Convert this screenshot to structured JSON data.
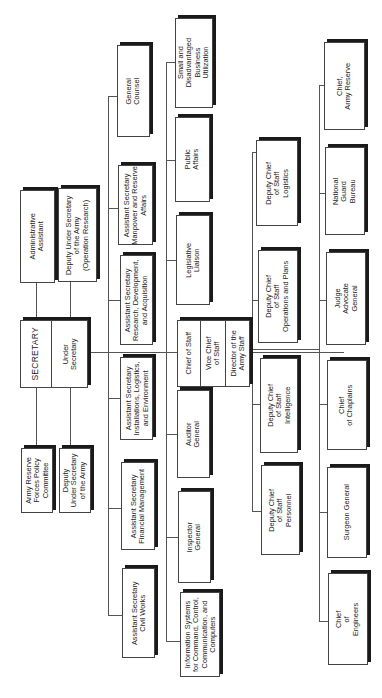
{
  "diagram": {
    "type": "org-chart",
    "orientation": "rotated-90-clockwise",
    "top": {
      "secretary": "SECRETARY",
      "under_secretary": "Under\nSecretary"
    },
    "staff_above": [
      {
        "id": "admin-assistant",
        "label": "Administrative\nAssistant"
      },
      {
        "id": "deputy-under-secretary-operation-research",
        "label": "Deputy Under Secretary\nof the Army\n(Operation Research)"
      }
    ],
    "staff_below": [
      {
        "id": "army-reserve-forces-policy-committee",
        "label": "Army Reserve\nForces Policy\nCommittee"
      },
      {
        "id": "deputy-under-secretary-army",
        "label": "Deputy\nUnder Secretary\nof the Army"
      }
    ],
    "assistant_secretaries": [
      {
        "id": "general-counsel",
        "label": "General\nCounsel"
      },
      {
        "id": "as-manpower-reserve",
        "label": "Assistant Secretary\nManpower and Reserve\nAffairs"
      },
      {
        "id": "as-research-development-acquisition",
        "label": "Assistant Secretary\nResearch, Development,\nand Acquisition"
      },
      {
        "id": "as-installations-logistics-environment",
        "label": "Assistant Secretary\nInstallations, Logistics,\nand Environment"
      },
      {
        "id": "as-financial-management",
        "label": "Assistant Secretary\nFinancial Management"
      },
      {
        "id": "as-civil-works",
        "label": "Assistant Secretary\nCivil Works"
      }
    ],
    "secretariat_offices": [
      {
        "id": "small-disadvantaged-business",
        "label": "Small and\nDisadvantaged\nBusiness\nUtilization"
      },
      {
        "id": "public-affairs",
        "label": "Public\nAffairs"
      },
      {
        "id": "legislative-liaison",
        "label": "Legislative\nLiaison"
      },
      {
        "id": "auditor-general",
        "label": "Auditor\nGeneral"
      },
      {
        "id": "inspector-general",
        "label": "Inspector\nGeneral"
      },
      {
        "id": "information-systems",
        "label": "Information Systems\nfor Command, Control,\nCommunication, and\nComputers"
      }
    ],
    "chief_of_staff": {
      "chief": "Chief of Staff",
      "vice": "Vice Chief\nof Staff",
      "director": "Director of the\nArmy Staff"
    },
    "deputy_chiefs": [
      {
        "id": "dcs-logistics",
        "label": "Deputy Chief\nof Staff\nLogistics"
      },
      {
        "id": "dcs-operations-plans",
        "label": "Deputy Chief\nof Staff\nOperations and Plans"
      },
      {
        "id": "dcs-intelligence",
        "label": "Deputy Chief\nof Staff\nIntelligence"
      },
      {
        "id": "dcs-personnel",
        "label": "Deputy Chief\nof Staff\nPersonnel"
      }
    ],
    "special_staff": [
      {
        "id": "chief-army-reserve",
        "label": "Chief,\nArmy Reserve"
      },
      {
        "id": "national-guard-bureau",
        "label": "National\nGuard\nBureau"
      },
      {
        "id": "judge-advocate-general",
        "label": "Judge\nAdvocate\nGeneral"
      },
      {
        "id": "chief-of-chaplains",
        "label": "Chief\nof Chaplains"
      },
      {
        "id": "surgeon-general",
        "label": "Surgeon General"
      },
      {
        "id": "chief-of-engineers",
        "label": "Chief\nof\nEngineers"
      }
    ]
  }
}
